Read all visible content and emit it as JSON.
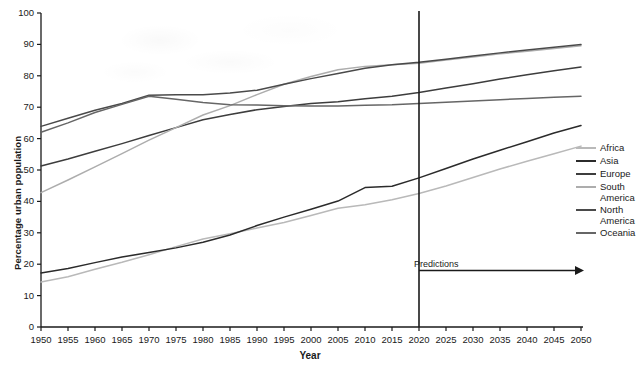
{
  "chart_data": {
    "type": "line",
    "title": "",
    "xlabel": "Year",
    "ylabel": "Percentage urban population",
    "xlim": [
      1950,
      2050
    ],
    "ylim": [
      0,
      100
    ],
    "ytick_step": 10,
    "xtick_step": 5,
    "grid": false,
    "legend_position": "right",
    "x": [
      1950,
      1955,
      1960,
      1965,
      1970,
      1975,
      1980,
      1985,
      1990,
      1995,
      2000,
      2005,
      2010,
      2015,
      2020,
      2025,
      2030,
      2035,
      2040,
      2045,
      2050
    ],
    "xticklabels": [
      "1950",
      "1955",
      "1960",
      "1965",
      "1970",
      "1975",
      "1980",
      "1985",
      "1990",
      "1995",
      "2000",
      "2005",
      "2010",
      "2015",
      "2020",
      "2025",
      "2030",
      "2035",
      "2040",
      "2045",
      "2050"
    ],
    "yticklabels": [
      "0",
      "10",
      "20",
      "30",
      "40",
      "50",
      "60",
      "70",
      "80",
      "90",
      "100"
    ],
    "series": [
      {
        "name": "Africa",
        "color": "#b9b9b9",
        "values": [
          14.3,
          16.0,
          18.4,
          20.6,
          23.0,
          25.6,
          28.0,
          29.7,
          31.5,
          33.3,
          35.5,
          37.8,
          38.9,
          40.5,
          42.5,
          44.9,
          47.6,
          50.3,
          52.8,
          55.2,
          57.6
        ]
      },
      {
        "name": "Asia",
        "color": "#2b2b2b",
        "values": [
          17.2,
          18.6,
          20.5,
          22.3,
          23.7,
          25.2,
          27.0,
          29.3,
          32.3,
          35.0,
          37.5,
          40.1,
          44.4,
          44.8,
          47.5,
          50.5,
          53.5,
          56.3,
          59.0,
          61.8,
          64.2
        ]
      },
      {
        "name": "Europe",
        "color": "#3d3d3d",
        "values": [
          51.3,
          53.5,
          56.0,
          58.4,
          61.0,
          63.5,
          66.0,
          67.7,
          69.2,
          70.2,
          71.2,
          71.7,
          72.7,
          73.5,
          74.7,
          76.1,
          77.5,
          79.0,
          80.3,
          81.6,
          82.8
        ]
      },
      {
        "name": "South\nAmerica",
        "color": "#adadad",
        "values": [
          42.8,
          46.8,
          51.0,
          55.2,
          59.5,
          63.5,
          67.5,
          70.5,
          74.0,
          77.3,
          79.8,
          81.9,
          83.0,
          83.5,
          84.0,
          85.0,
          86.0,
          87.0,
          87.8,
          88.7,
          89.6
        ]
      },
      {
        "name": "North\nAmerica",
        "color": "#4a4a4a",
        "values": [
          63.9,
          66.5,
          69.0,
          71.2,
          73.8,
          74.0,
          74.0,
          74.5,
          75.4,
          77.3,
          79.1,
          80.7,
          82.4,
          83.5,
          84.3,
          85.3,
          86.3,
          87.3,
          88.2,
          89.1,
          90.0
        ]
      },
      {
        "name": "Oceania",
        "color": "#666666",
        "values": [
          62.0,
          65.0,
          68.3,
          70.9,
          73.5,
          72.5,
          71.5,
          70.8,
          70.7,
          70.5,
          70.4,
          70.4,
          70.6,
          70.8,
          71.2,
          71.6,
          72.0,
          72.4,
          72.8,
          73.2,
          73.5
        ]
      }
    ],
    "annotations": [
      {
        "name": "predictions",
        "label": "Predictions",
        "x": 2020,
        "marker_line_year": 2020,
        "arrow_to_year": 2050,
        "arrow_y": 18
      }
    ],
    "axis_color": "#1a1a1a"
  }
}
